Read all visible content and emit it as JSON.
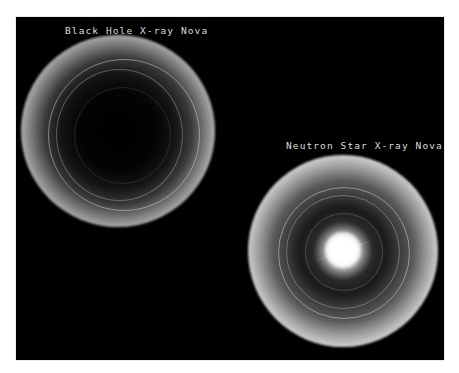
{
  "figure": {
    "background": "#000000",
    "border_color": "#ffffff",
    "panels": [
      {
        "id": "black-hole",
        "label": "Black Hole X-ray Nova",
        "description": "Accretion disk with dark empty center"
      },
      {
        "id": "neutron-star",
        "label": "Neutron Star X-ray Nova",
        "description": "Accretion disk with bright glowing central star"
      }
    ]
  }
}
